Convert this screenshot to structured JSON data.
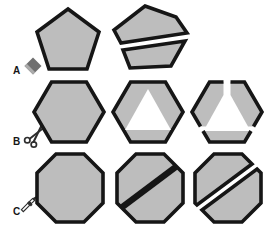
{
  "diagram": {
    "rows": [
      {
        "label": "A",
        "icon": "eraser-icon",
        "shape": "pentagon"
      },
      {
        "label": "B",
        "icon": "scissors-icon",
        "shape": "hexagon"
      },
      {
        "label": "C",
        "icon": "knife-icon",
        "shape": "octagon"
      }
    ]
  },
  "colors": {
    "shape-fill": "#bdbdbd",
    "shape-outline": "#161616",
    "background": "#ffffff",
    "eraser-dark": "#6f6f6f",
    "eraser-light": "#ababab",
    "icon-stroke": "#2e2e2e"
  }
}
